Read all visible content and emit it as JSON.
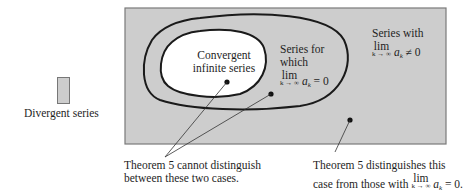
{
  "colors": {
    "divergent_fill": "#cdcdcd",
    "divergent_border": "#7a7a7a",
    "convergent_fill": "#ffffff",
    "oval_stroke": "#1a1a1a",
    "pointer_line": "#333333"
  },
  "legend": {
    "label": "Divergent series"
  },
  "regions": {
    "convergent": {
      "line1": "Convergent",
      "line2": "infinite series"
    },
    "limit_zero": {
      "line1": "Series for",
      "line2": "which",
      "lim": "lim",
      "lim_sub": "k → ∞",
      "a": "a",
      "a_sub": "k",
      "relation": "= 0"
    },
    "limit_nonzero": {
      "line1": "Series with",
      "lim": "lim",
      "lim_sub": "k → ∞",
      "a": "a",
      "a_sub": "k",
      "relation": "≠ 0"
    }
  },
  "annotations": {
    "left": {
      "line1": "Theorem 5 cannot distinguish",
      "line2": "between these two cases."
    },
    "right": {
      "line1": "Theorem 5 distinguishes this",
      "line2_prefix": "case from those with",
      "lim": "lim",
      "lim_sub": "k → ∞",
      "a": "a",
      "a_sub": "k",
      "relation": "= 0."
    }
  }
}
